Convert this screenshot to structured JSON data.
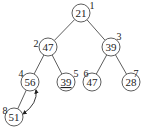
{
  "diagram": {
    "type": "binary-heap-tree",
    "nodes": [
      {
        "id": 1,
        "value": "21",
        "index_label": "1",
        "x": 81,
        "y": 13,
        "lx": 92,
        "ly": 6,
        "underline": false
      },
      {
        "id": 2,
        "value": "47",
        "index_label": "2",
        "x": 48,
        "y": 47,
        "lx": 36,
        "ly": 44,
        "underline": false
      },
      {
        "id": 3,
        "value": "39",
        "index_label": "3",
        "x": 111,
        "y": 47,
        "lx": 119,
        "ly": 37,
        "underline": false
      },
      {
        "id": 4,
        "value": "56",
        "index_label": "4",
        "x": 30,
        "y": 82,
        "lx": 21,
        "ly": 74,
        "underline": false
      },
      {
        "id": 5,
        "value": "39",
        "index_label": "5",
        "x": 66,
        "y": 82,
        "lx": 76,
        "ly": 74,
        "underline": true
      },
      {
        "id": 6,
        "value": "47",
        "index_label": "6",
        "x": 92,
        "y": 82,
        "lx": 86,
        "ly": 74,
        "underline": false
      },
      {
        "id": 7,
        "value": "28",
        "index_label": "7",
        "x": 131,
        "y": 82,
        "lx": 136,
        "ly": 74,
        "underline": false
      },
      {
        "id": 8,
        "value": "51",
        "index_label": "8",
        "x": 14,
        "y": 117,
        "lx": 5,
        "ly": 111,
        "underline": false
      }
    ],
    "edges": [
      [
        1,
        2
      ],
      [
        1,
        3
      ],
      [
        2,
        4
      ],
      [
        2,
        5
      ],
      [
        3,
        6
      ],
      [
        3,
        7
      ],
      [
        4,
        8
      ]
    ],
    "swap_arrow": {
      "from": 8,
      "to": 4,
      "bidirectional": true
    }
  }
}
